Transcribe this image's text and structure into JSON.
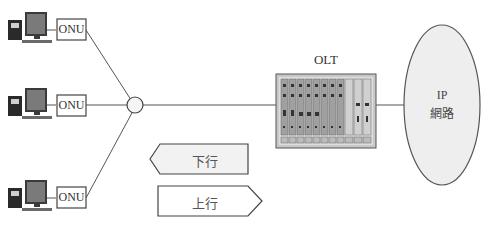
{
  "diagram": {
    "onus": [
      {
        "label": "ONU"
      },
      {
        "label": "ONU"
      },
      {
        "label": "ONU"
      }
    ],
    "splitter": {
      "label": ""
    },
    "olt": {
      "label": "OLT"
    },
    "ip_network": {
      "line1": "IP",
      "line2": "網路"
    },
    "arrows": {
      "downstream": {
        "label": "下行",
        "direction": "left"
      },
      "upstream": {
        "label": "上行",
        "direction": "right"
      }
    },
    "colors": {
      "line": "#555555",
      "box_fill": "#ffffff",
      "arrow_fill": "#f2f2f2",
      "ellipse_fill": "#eeeeee",
      "rack": "#9a9a9a"
    }
  }
}
